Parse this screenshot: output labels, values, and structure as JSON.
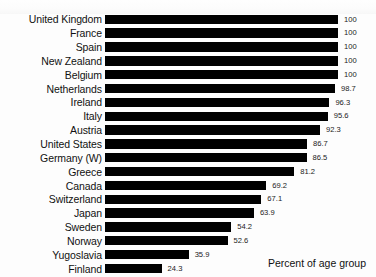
{
  "chart_data": {
    "type": "bar",
    "orientation": "horizontal",
    "title": "",
    "subtitle": "",
    "xlabel": "Percent of age group",
    "ylabel": "",
    "xlim": [
      0,
      100
    ],
    "grid": false,
    "legend": null,
    "bar_color": "#000000",
    "background_color": "#ffffff",
    "value_label_format": "one decimal, integers shown without decimal",
    "categories": [
      "United Kingdom",
      "France",
      "Spain",
      "New Zealand",
      "Belgium",
      "Netherlands",
      "Ireland",
      "Italy",
      "Austria",
      "United States",
      "Germany (W)",
      "Greece",
      "Canada",
      "Switzerland",
      "Japan",
      "Sweden",
      "Norway",
      "Yugoslavia",
      "Finland"
    ],
    "values": [
      100,
      100,
      100,
      100,
      100,
      98.7,
      96.3,
      95.6,
      92.3,
      86.7,
      86.5,
      81.2,
      69.2,
      67.1,
      63.9,
      54.2,
      52.6,
      35.9,
      24.3
    ],
    "value_labels": [
      "100",
      "100",
      "100",
      "100",
      "100",
      "98.7",
      "96.3",
      "95.6",
      "92.3",
      "86.7",
      "86.5",
      "81.2",
      "69.2",
      "67.1",
      "63.9",
      "54.2",
      "52.6",
      "35.9",
      "24.3"
    ]
  },
  "axis_note": {
    "text": "Percent of age group"
  }
}
